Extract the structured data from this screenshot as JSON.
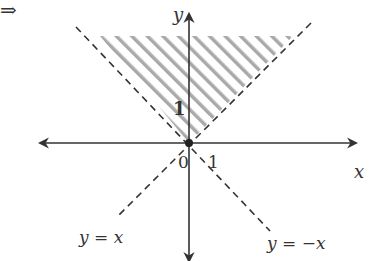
{
  "diagram": {
    "implies_symbol": "⇒",
    "axes": {
      "x_label": "x",
      "y_label": "y",
      "origin_label": "0",
      "x_tick_label": "1",
      "y_tick_label": "1"
    },
    "lines": [
      {
        "label": "y = x",
        "style": "dashed"
      },
      {
        "label": "y = −x",
        "style": "dashed"
      }
    ],
    "shaded_region": {
      "description": "region above both y = x and y = -x (y > |x|)",
      "pattern": "diagonal-hatch"
    },
    "colors": {
      "axis": "#333333",
      "dashed": "#333333",
      "hatch": "#a9a9a9",
      "background": "#ffffff"
    }
  }
}
